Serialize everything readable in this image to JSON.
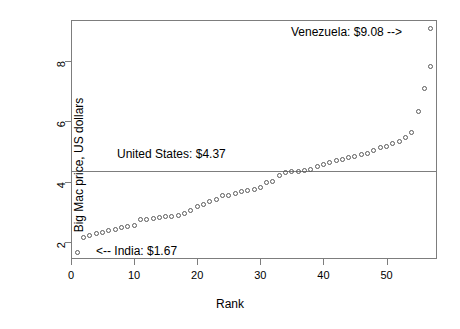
{
  "chart_data": {
    "type": "scatter",
    "title": "",
    "xlabel": "Rank",
    "ylabel": "Big Mac price, US dollars",
    "xlim": [
      0,
      58
    ],
    "ylim": [
      1.45,
      9.35
    ],
    "xticks": [
      0,
      10,
      20,
      30,
      40,
      50
    ],
    "yticks": [
      2,
      4,
      6,
      8
    ],
    "grid": false,
    "legend": null,
    "marker": "open-circle",
    "x": [
      1,
      2,
      3,
      4,
      5,
      6,
      7,
      8,
      9,
      10,
      11,
      12,
      13,
      14,
      15,
      16,
      17,
      18,
      19,
      20,
      21,
      22,
      23,
      24,
      25,
      26,
      27,
      28,
      29,
      30,
      31,
      32,
      33,
      34,
      35,
      36,
      37,
      38,
      39,
      40,
      41,
      42,
      43,
      44,
      45,
      46,
      47,
      48,
      49,
      50,
      51,
      52,
      53,
      54,
      55,
      56,
      57
    ],
    "y": [
      1.67,
      2.16,
      2.22,
      2.29,
      2.34,
      2.39,
      2.44,
      2.5,
      2.51,
      2.56,
      2.74,
      2.77,
      2.8,
      2.82,
      2.84,
      2.86,
      2.88,
      2.94,
      3.04,
      3.2,
      3.26,
      3.34,
      3.43,
      3.54,
      3.56,
      3.62,
      3.68,
      3.72,
      3.76,
      3.82,
      3.97,
      4.02,
      4.2,
      4.3,
      4.33,
      4.35,
      4.37,
      4.41,
      4.5,
      4.56,
      4.63,
      4.7,
      4.75,
      4.8,
      4.85,
      4.89,
      4.94,
      5.04,
      5.13,
      5.18,
      5.26,
      5.35,
      5.46,
      5.63,
      6.32,
      7.07,
      7.8
    ],
    "reference_line": {
      "value": 4.37,
      "label": "United States: $4.37",
      "orientation": "horizontal"
    },
    "annotations": [
      {
        "name": "venezuela",
        "text": "Venezuela: $9.08 -->",
        "value": 9.08,
        "rank": 57
      },
      {
        "name": "united-states",
        "text": "United States: $4.37",
        "value": 4.37
      },
      {
        "name": "india",
        "text": "<-- India: $1.67",
        "value": 1.67,
        "rank": 1
      }
    ],
    "highlight_points": [
      {
        "name": "venezuela-point",
        "x": 57,
        "y": 9.08
      }
    ]
  },
  "axes": {
    "x": {
      "label": "Rank",
      "ticklabels": [
        "0",
        "10",
        "20",
        "30",
        "40",
        "50"
      ]
    },
    "y": {
      "label": "Big Mac price, US dollars",
      "ticklabels": [
        "2",
        "4",
        "6",
        "8"
      ]
    }
  },
  "annotations": {
    "venezuela": "Venezuela: $9.08 -->",
    "united_states": "United States: $4.37",
    "india": "<-- India: $1.67"
  },
  "colors": {
    "background": "#ffffff",
    "frame": "#7d7d7d",
    "marker": "#5a5a5a",
    "refline": "#7d7d7d",
    "text": "#000000"
  }
}
